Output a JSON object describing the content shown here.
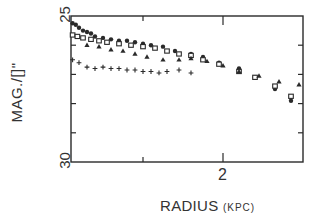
{
  "chart_data": {
    "type": "scatter",
    "title": "",
    "xlabel": "RADIUS",
    "xlabel_unit": "(KPC)",
    "ylabel": "MAG./[]\"",
    "xlim": [
      0.1,
      3.0
    ],
    "ylim": [
      30,
      25
    ],
    "y_inverted": true,
    "x_tick_labels": [
      {
        "value": 2,
        "label": "2"
      }
    ],
    "x_minor_ticks": [
      1,
      2
    ],
    "y_tick_labels": [
      {
        "value": 25,
        "label": "25"
      },
      {
        "value": 30,
        "label": "30"
      }
    ],
    "y_minor_ticks": [
      26,
      27,
      28,
      29
    ],
    "grid": false,
    "legend": null,
    "series": [
      {
        "name": "filled circles",
        "marker": "circle-filled",
        "points": [
          [
            0.12,
            25.25
          ],
          [
            0.16,
            25.3
          ],
          [
            0.2,
            25.4
          ],
          [
            0.25,
            25.5
          ],
          [
            0.3,
            25.55
          ],
          [
            0.35,
            25.6
          ],
          [
            0.4,
            25.7
          ],
          [
            0.5,
            25.75
          ],
          [
            0.6,
            25.8
          ],
          [
            0.7,
            25.85
          ],
          [
            0.8,
            25.85
          ],
          [
            0.9,
            25.9
          ],
          [
            1.0,
            25.95
          ],
          [
            1.1,
            26.0
          ],
          [
            1.25,
            26.05
          ],
          [
            1.4,
            26.2
          ],
          [
            1.6,
            26.3
          ],
          [
            1.75,
            26.4
          ],
          [
            1.95,
            26.6
          ],
          [
            2.2,
            26.8
          ],
          [
            2.4,
            27.1
          ],
          [
            2.65,
            27.5
          ],
          [
            2.85,
            27.9
          ]
        ]
      },
      {
        "name": "open squares",
        "marker": "square-open",
        "points": [
          [
            0.12,
            25.65
          ],
          [
            0.18,
            25.7
          ],
          [
            0.25,
            25.75
          ],
          [
            0.35,
            25.8
          ],
          [
            0.45,
            25.85
          ],
          [
            0.55,
            25.9
          ],
          [
            0.7,
            25.95
          ],
          [
            0.85,
            26.0
          ],
          [
            1.0,
            26.05
          ],
          [
            1.15,
            26.1
          ],
          [
            1.3,
            26.2
          ],
          [
            1.45,
            26.3
          ],
          [
            1.6,
            26.35
          ],
          [
            1.75,
            26.5
          ],
          [
            1.95,
            26.65
          ],
          [
            2.2,
            26.9
          ],
          [
            2.4,
            27.1
          ],
          [
            2.65,
            27.4
          ],
          [
            2.85,
            27.75
          ]
        ]
      },
      {
        "name": "triangles",
        "marker": "triangle-filled",
        "points": [
          [
            0.3,
            26.0
          ],
          [
            0.45,
            26.05
          ],
          [
            0.6,
            26.15
          ],
          [
            0.75,
            26.2
          ],
          [
            0.9,
            26.3
          ],
          [
            1.05,
            26.4
          ],
          [
            1.25,
            26.5
          ],
          [
            1.45,
            26.5
          ],
          [
            1.6,
            26.45
          ],
          [
            1.8,
            26.55
          ],
          [
            2.0,
            26.7
          ],
          [
            2.2,
            26.9
          ],
          [
            2.45,
            27.05
          ],
          [
            2.7,
            27.25
          ],
          [
            2.95,
            27.35
          ]
        ]
      },
      {
        "name": "crosses",
        "marker": "plus",
        "points": [
          [
            0.12,
            26.5
          ],
          [
            0.2,
            26.6
          ],
          [
            0.3,
            26.75
          ],
          [
            0.4,
            26.8
          ],
          [
            0.5,
            26.75
          ],
          [
            0.6,
            26.8
          ],
          [
            0.7,
            26.8
          ],
          [
            0.8,
            26.85
          ],
          [
            0.9,
            26.85
          ],
          [
            1.0,
            26.9
          ],
          [
            1.1,
            26.9
          ],
          [
            1.2,
            26.95
          ],
          [
            1.3,
            26.9
          ],
          [
            1.45,
            26.85
          ],
          [
            1.6,
            26.95
          ]
        ]
      }
    ]
  },
  "labels": {
    "y_axis_title": "MAG./[]\"",
    "y_top": "25",
    "y_bottom": "30",
    "x_tick": "2",
    "x_axis_title": "RADIUS",
    "x_axis_unit": "(KPC)"
  },
  "colors": {
    "ink": "#2a2a2a",
    "background": "#ffffff"
  }
}
